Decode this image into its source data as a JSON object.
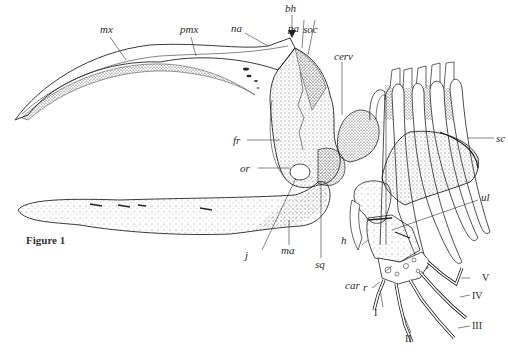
{
  "figure": {
    "caption": "Figure 1"
  },
  "labels": {
    "mx": "mx",
    "pmx": "pmx",
    "na": "na",
    "bh": "bh",
    "pa": "pa",
    "soc": "soc",
    "cerv": "cerv",
    "sc": "sc",
    "fr": "fr",
    "or": "or",
    "ul": "ul",
    "h": "h",
    "j": "j",
    "ma": "ma",
    "sq": "sq",
    "r": "r",
    "car": "car",
    "digit_I": "I",
    "digit_II": "II",
    "digit_III": "III",
    "digit_IV": "IV",
    "digit_V": "V"
  },
  "colors": {
    "ink": "#2a2a2a",
    "stipple": "#555555",
    "background": "#ffffff"
  }
}
